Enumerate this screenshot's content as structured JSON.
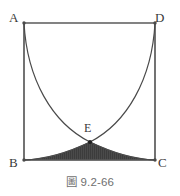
{
  "figure": {
    "caption": "圖 9.2-66",
    "labels": {
      "A": "A",
      "B": "B",
      "C": "C",
      "D": "D",
      "E": "E"
    },
    "colors": {
      "stroke": "#5a5a5a",
      "curve": "#4a4a4a",
      "shaded_region_fill": "#4a4a4a",
      "label_text": "#3a3a3a",
      "caption_text": "#6f6f6f",
      "background": "#ffffff"
    },
    "geometry": {
      "square_corners": {
        "A": [
          24,
          23
        ],
        "D": [
          155,
          23
        ],
        "B": [
          24,
          160
        ],
        "C": [
          155,
          160
        ]
      },
      "intersection_point_E": [
        90,
        142
      ],
      "curve_left_from": "A",
      "curve_left_to": "C",
      "curve_right_from": "D",
      "curve_right_to": "B",
      "shaded_region": "region bounded below by BC and above by the two arcs meeting at E"
    }
  }
}
